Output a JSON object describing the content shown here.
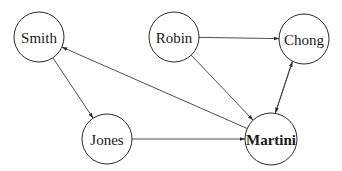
{
  "diagram": {
    "type": "directed-graph",
    "nodes": [
      {
        "id": "smith",
        "label": "Smith",
        "cx": 39,
        "cy": 37,
        "r": 25,
        "bold": false
      },
      {
        "id": "robin",
        "label": "Robin",
        "cx": 174,
        "cy": 37,
        "r": 25,
        "bold": false
      },
      {
        "id": "chong",
        "label": "Chong",
        "cx": 304,
        "cy": 39,
        "r": 25,
        "bold": false
      },
      {
        "id": "jones",
        "label": "Jones",
        "cx": 107,
        "cy": 139,
        "r": 25,
        "bold": false
      },
      {
        "id": "martini",
        "label": "Martini",
        "cx": 271,
        "cy": 139,
        "r": 26,
        "bold": true
      }
    ],
    "edges": [
      {
        "from": "smith",
        "to": "jones"
      },
      {
        "from": "martini",
        "to": "smith"
      },
      {
        "from": "robin",
        "to": "chong"
      },
      {
        "from": "robin",
        "to": "martini"
      },
      {
        "from": "jones",
        "to": "martini"
      },
      {
        "from": "martini",
        "to": "chong",
        "offset": -4
      },
      {
        "from": "chong",
        "to": "martini",
        "offset": 4
      }
    ],
    "colors": {
      "stroke": "#2a2a2a",
      "background": "#ffffff"
    }
  }
}
